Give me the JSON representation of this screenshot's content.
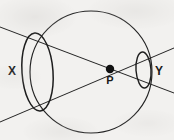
{
  "figure": {
    "background_color": "#f2f1ef",
    "ink_color": "#1a1a1a",
    "labels": {
      "left_ellipse": "X",
      "right_ellipse": "Y",
      "point": "P"
    },
    "geometry": {
      "circle": {
        "cx": 91,
        "cy": 72,
        "r": 61
      },
      "point_p": {
        "x": 110,
        "y": 69,
        "radius": 4.2
      },
      "ellipse_x": {
        "cx": 37.5,
        "cy": 72,
        "rx": 15.5,
        "ry": 39,
        "rotation_deg": -4
      },
      "ellipse_y": {
        "cx": 143.5,
        "cy": 70,
        "rx": 7.5,
        "ry": 18,
        "rotation_deg": -4
      },
      "line_upper": {
        "x1": 0,
        "y1": 27,
        "x2": 174,
        "y2": 93
      },
      "line_lower": {
        "x1": 0,
        "y1": 122,
        "x2": 174,
        "y2": 48
      }
    }
  }
}
